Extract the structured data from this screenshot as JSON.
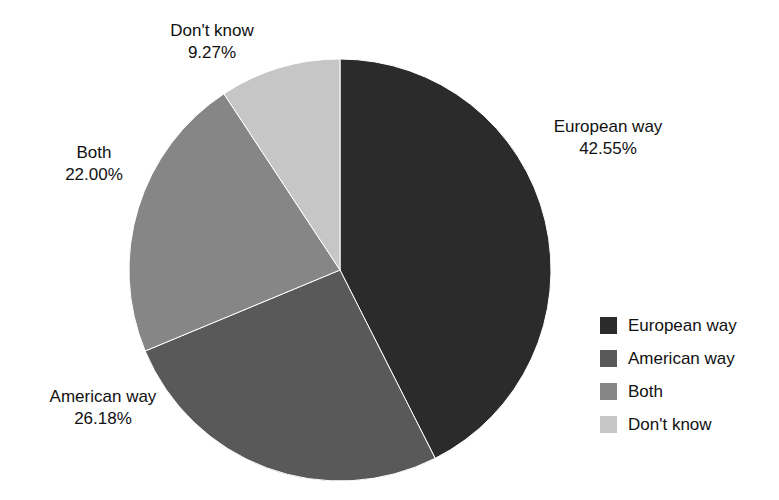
{
  "chart_data": {
    "type": "pie",
    "title": "",
    "subtitle": "",
    "xlabel": "",
    "ylabel": "",
    "grid": false,
    "legend_position": "right",
    "start_angle_deg": 0,
    "direction": "clockwise",
    "units": "percent",
    "categories": [
      "European way",
      "American way",
      "Both",
      "Don't know"
    ],
    "values": [
      42.55,
      26.18,
      22.0,
      9.27
    ],
    "value_labels": [
      "42.55%",
      "26.18%",
      "22.00%",
      "9.27%"
    ],
    "colors": [
      "#2b2b2b",
      "#595959",
      "#868686",
      "#c6c6c6"
    ],
    "slices": [
      {
        "label": "European way",
        "value": 42.55,
        "value_label": "42.55%",
        "color": "#2b2b2b"
      },
      {
        "label": "American way",
        "value": 26.18,
        "value_label": "26.18%",
        "color": "#595959"
      },
      {
        "label": "Both",
        "value": 22.0,
        "value_label": "22.00%",
        "color": "#868686"
      },
      {
        "label": "Don't know",
        "value": 9.27,
        "value_label": "9.27%",
        "color": "#c6c6c6"
      }
    ]
  },
  "callouts": {
    "dont_know": {
      "name": "Don't know",
      "percent": "9.27%"
    },
    "european": {
      "name": "European way",
      "percent": "42.55%"
    },
    "both": {
      "name": "Both",
      "percent": "22.00%"
    },
    "american": {
      "name": "American way",
      "percent": "26.18%"
    }
  },
  "legend": {
    "items": [
      {
        "label": "European way",
        "color": "#2b2b2b"
      },
      {
        "label": "American way",
        "color": "#595959"
      },
      {
        "label": "Both",
        "color": "#868686"
      },
      {
        "label": "Don't know",
        "color": "#c6c6c6"
      }
    ]
  }
}
